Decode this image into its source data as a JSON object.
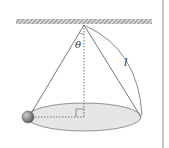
{
  "diagram": {
    "labels": {
      "angle": "θ",
      "length": "l"
    },
    "colors": {
      "ceiling_hatch": "#888888",
      "string": "#555555",
      "ellipse_fill": "#e4e4e4",
      "ellipse_stroke": "#777777",
      "ball": "#8a8a8a",
      "divider": "#c8c8c8"
    }
  }
}
